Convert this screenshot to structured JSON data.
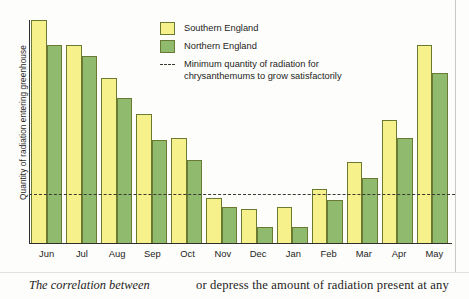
{
  "chart_data": {
    "type": "bar",
    "title": "",
    "xlabel": "",
    "ylabel": "Quantity of radiation entering greenhouse",
    "ylim": [
      0,
      100
    ],
    "grid": false,
    "legend_position": "top-right",
    "categories": [
      "Jun",
      "Jul",
      "Aug",
      "Sep",
      "Oct",
      "Nov",
      "Dec",
      "Jan",
      "Feb",
      "Mar",
      "Apr",
      "May"
    ],
    "series": [
      {
        "name": "Southern England",
        "color": "#f6f18a",
        "values": [
          100,
          89,
          74,
          58,
          47,
          20,
          15,
          16,
          24,
          36,
          55,
          89
        ]
      },
      {
        "name": "Northern England",
        "color": "#90ba6d",
        "values": [
          89,
          84,
          65,
          46,
          37,
          16,
          7,
          7,
          19,
          29,
          47,
          76
        ]
      }
    ],
    "annotations": [
      {
        "type": "threshold-line",
        "value": 22,
        "style": "dashed",
        "color": "#3a3a30",
        "label_line1": "Minimum quantity of radiation for",
        "label_line2": "chrysanthemums to grow satisfactorily"
      }
    ]
  },
  "legend": {
    "items": [
      {
        "label": "Southern England",
        "swatch": "yellow-swatch"
      },
      {
        "label": "Northern England",
        "swatch": "green-swatch"
      }
    ],
    "threshold": {
      "line1": "Minimum quantity of radiation for",
      "line2": "chrysanthemums to grow satisfactorily"
    }
  },
  "axes": {
    "y_title": "Quantity of radiation entering greenhouse"
  },
  "caption": {
    "left_italic": "The correlation between",
    "right_text": "or depress the amount of radiation present at any"
  }
}
